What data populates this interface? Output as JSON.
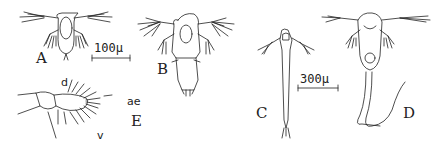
{
  "figure": {
    "panels": [
      {
        "id": "A",
        "label": "A",
        "description": "nauplius, dorsal view"
      },
      {
        "id": "B",
        "label": "B",
        "description": "later nauplius stage with tapered posterior"
      },
      {
        "id": "C",
        "label": "C",
        "description": "elongated larva with long trunk"
      },
      {
        "id": "D",
        "label": "D",
        "description": "nauplius with long paired caudal filaments"
      },
      {
        "id": "E",
        "label": "E",
        "description": "appendage detail with setae"
      }
    ],
    "scale_bars": [
      {
        "label": "100μ",
        "applies_to": "A"
      },
      {
        "label": "300μ",
        "applies_to": "C"
      }
    ],
    "annotations": {
      "d": "d",
      "ae": "ae",
      "v": "v"
    },
    "colors": {
      "ink": "#222222",
      "background": "#ffffff"
    }
  }
}
